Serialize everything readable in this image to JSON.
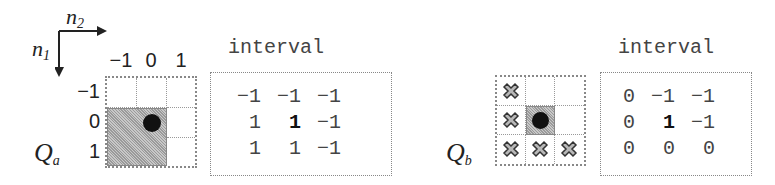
{
  "axes": {
    "n1_label": "n",
    "n1_sub": "1",
    "n2_label": "n",
    "n2_sub": "2"
  },
  "qa": {
    "label": "Q",
    "label_sub": "a",
    "col_ticks": [
      "−1",
      "0",
      "1"
    ],
    "row_ticks": [
      "−1",
      "0",
      "1"
    ],
    "interval_title": "interval",
    "interval": [
      [
        "−1",
        "−1",
        "−1"
      ],
      [
        "1",
        "1",
        "−1"
      ],
      [
        "1",
        "1",
        "−1"
      ]
    ],
    "center": [
      1,
      1
    ]
  },
  "qb": {
    "label": "Q",
    "label_sub": "b",
    "interval_title": "interval",
    "interval": [
      [
        "0",
        "−1",
        "−1"
      ],
      [
        "0",
        "1",
        "−1"
      ],
      [
        "0",
        "0",
        "0"
      ]
    ],
    "x_marks": [
      [
        0,
        0
      ],
      [
        1,
        0
      ],
      [
        2,
        0
      ],
      [
        2,
        1
      ],
      [
        2,
        2
      ]
    ],
    "center": [
      1,
      1
    ]
  },
  "colors": {
    "shade": "#b0b0b0",
    "dot": "#111111",
    "border": "#888888"
  }
}
